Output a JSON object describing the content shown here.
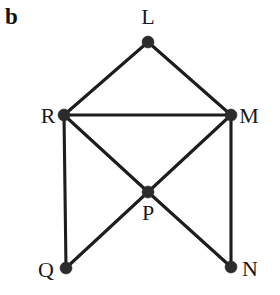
{
  "figure": {
    "panel_label": "b",
    "width": 280,
    "height": 295,
    "background_color": "#ffffff",
    "ink_color": "#1d1d1d",
    "node_color": "#2b2b2b"
  },
  "chart_data": {
    "type": "diagram",
    "title": "b",
    "subtitle": "",
    "xlabel": "",
    "ylabel": "",
    "graph_kind": "undirected-graph",
    "node_radius": 6,
    "nodes": [
      {
        "id": "L",
        "label": "L",
        "x": 148,
        "y": 42,
        "label_x": 148,
        "label_y": 24,
        "label_anchor": "middle"
      },
      {
        "id": "R",
        "label": "R",
        "x": 64,
        "y": 115,
        "label_x": 48,
        "label_y": 123,
        "label_anchor": "middle"
      },
      {
        "id": "M",
        "label": "M",
        "x": 231,
        "y": 115,
        "label_x": 249,
        "label_y": 123,
        "label_anchor": "middle"
      },
      {
        "id": "P",
        "label": "P",
        "x": 148,
        "y": 192,
        "label_x": 148,
        "label_y": 220,
        "label_anchor": "middle"
      },
      {
        "id": "Q",
        "label": "Q",
        "x": 66,
        "y": 268,
        "label_x": 46,
        "label_y": 277,
        "label_anchor": "middle"
      },
      {
        "id": "N",
        "label": "N",
        "x": 231,
        "y": 267,
        "label_x": 250,
        "label_y": 276,
        "label_anchor": "middle"
      }
    ],
    "edges": [
      {
        "from": "L",
        "to": "R"
      },
      {
        "from": "L",
        "to": "M"
      },
      {
        "from": "R",
        "to": "M"
      },
      {
        "from": "R",
        "to": "P"
      },
      {
        "from": "M",
        "to": "P"
      },
      {
        "from": "R",
        "to": "Q"
      },
      {
        "from": "M",
        "to": "N"
      },
      {
        "from": "P",
        "to": "Q"
      },
      {
        "from": "P",
        "to": "N"
      }
    ],
    "node_count": 6,
    "edge_count": 9,
    "legend": [],
    "annotations": []
  }
}
